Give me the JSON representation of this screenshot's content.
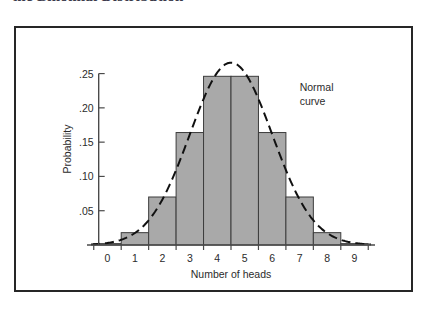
{
  "caption": {
    "text": "the Binomial Distribution"
  },
  "figure": {
    "frame_color": "#262626",
    "background": "#ffffff"
  },
  "chart_data": {
    "type": "bar",
    "title": "",
    "subtitle": "",
    "xlabel": "Number of heads",
    "ylabel": "Probability",
    "categories": [
      "0",
      "1",
      "2",
      "3",
      "4",
      "5",
      "6",
      "7",
      "8",
      "9"
    ],
    "values": [
      0.002,
      0.018,
      0.07,
      0.164,
      0.246,
      0.246,
      0.164,
      0.07,
      0.018,
      0.002
    ],
    "xlim": [
      -0.6,
      9.6
    ],
    "ylim": [
      0,
      0.28
    ],
    "x_tick_labels": [
      "0",
      "1",
      "2",
      "3",
      "4",
      "5",
      "6",
      "7",
      "8",
      "9"
    ],
    "y_tick_labels": [
      ".05",
      ".10",
      ".15",
      ".20",
      ".25"
    ],
    "y_tick_values": [
      0.05,
      0.1,
      0.15,
      0.2,
      0.25
    ],
    "grid": false,
    "legend": "none",
    "bar_fill_color": "#a9a9a9",
    "bar_edge_color": "#3c3c3c",
    "overlay": {
      "type": "line",
      "name": "Normal curve",
      "style": "dashed",
      "color": "#111111",
      "mean": 4.5,
      "stddev": 1.5,
      "peak_value": 0.266
    },
    "annotations": [
      {
        "name": "normal-curve-label",
        "line1": "Normal",
        "line2": "curve",
        "x": 7.0,
        "y": 0.225
      }
    ]
  }
}
